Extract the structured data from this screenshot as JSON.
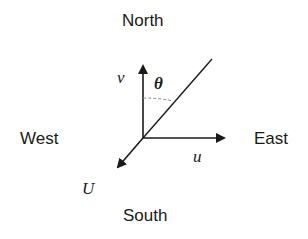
{
  "compass": {
    "north": "North",
    "south": "South",
    "east": "East",
    "west": "West"
  },
  "vectors": {
    "v_label": "v",
    "u_label": "u",
    "U_label": "U",
    "theta_label": "θ"
  },
  "colors": {
    "stroke": "#1a1a1a",
    "dash": "#888888",
    "background": "#ffffff"
  }
}
